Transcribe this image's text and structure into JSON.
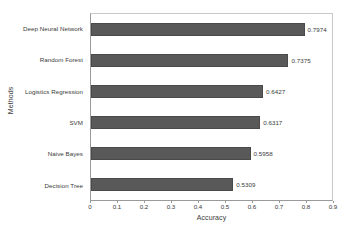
{
  "chart_data": {
    "type": "bar",
    "orientation": "horizontal",
    "title": "",
    "xlabel": "Accuracy",
    "ylabel": "Methods",
    "categories": [
      "Deep Neural Network",
      "Random Forest",
      "Logistics Regression",
      "SVM",
      "Naive Bayes",
      "Decision Tree"
    ],
    "values": [
      0.7974,
      0.7375,
      0.6427,
      0.6317,
      0.5958,
      0.5309
    ],
    "value_labels": [
      "0.7974",
      "0.7375",
      "0.6427",
      "0.6317",
      "0.5958",
      "0.5309"
    ],
    "xlim": [
      0,
      0.9
    ],
    "xticks": [
      0,
      0.1,
      0.2,
      0.3,
      0.4,
      0.5,
      0.6,
      0.7,
      0.8,
      0.9
    ],
    "xtick_labels": [
      "0",
      "0.1",
      "0.2",
      "0.3",
      "0.4",
      "0.5",
      "0.6",
      "0.7",
      "0.8",
      "0.9"
    ],
    "grid": false,
    "legend": false,
    "bar_color": "#595959",
    "bar_edge_color": "#4a4a4a",
    "background_color": "#ffffff",
    "text_color": "#3a3a3a"
  }
}
